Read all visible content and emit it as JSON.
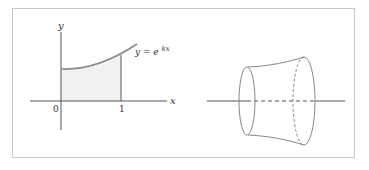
{
  "figure": {
    "left_panel": {
      "axis_labels": {
        "x": "x",
        "y": "y"
      },
      "tick_labels": [
        "0",
        "1"
      ],
      "curve_label": {
        "prefix": "y = e",
        "exponent": "kx"
      },
      "shaded_region": "area under y = e^{kx} from x = 0 to x = 1",
      "colors": {
        "curve": "#888888",
        "fill": "#f0f0f0",
        "axes": "#444444"
      }
    },
    "right_panel": {
      "description": "solid of revolution obtained by rotating the region about the x-axis",
      "colors": {
        "outline": "#777777",
        "axis": "#444444"
      }
    }
  }
}
